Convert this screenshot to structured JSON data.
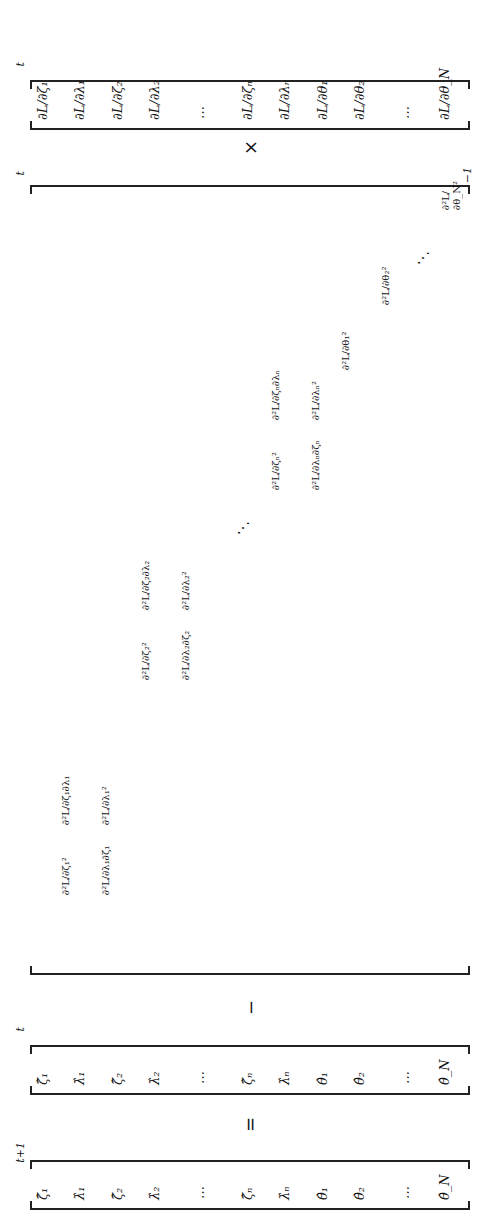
{
  "equation": {
    "lhs": {
      "label": "theta_hat_vector",
      "items": [
        "ζ̂₁",
        "λ̂₁",
        "ζ̂₂",
        "λ̂₂",
        "⋯",
        "ζ̂ₙ",
        "λ̂ₙ",
        "θ̂₁",
        "θ̂₂",
        "⋯",
        "θ̂_N"
      ],
      "superscript": "t+1"
    },
    "equals": "=",
    "current": {
      "items": [
        "ζ̂₁",
        "λ̂₁",
        "ζ̂₂",
        "λ̂₂",
        "⋯",
        "ζ̂ₙ",
        "λ̂ₙ",
        "θ̂₁",
        "θ̂₂",
        "⋯",
        "θ̂_N"
      ],
      "superscript": "t"
    },
    "minus": "−",
    "hessian": {
      "superscript": "t",
      "inverse": "−1",
      "blocks": [
        [
          "∂²L/∂ζ₁²",
          "∂²L/∂ζ₁∂λ₁",
          "∂²L/∂λ₁∂ζ₁",
          "∂²L/∂λ₁²"
        ],
        [
          "∂²L/∂ζ₂²",
          "∂²L/∂ζ₂∂λ₂",
          "∂²L/∂λ₂∂ζ₂",
          "∂²L/∂λ₂²"
        ],
        [
          "∂²L/∂ζₙ²",
          "∂²L/∂ζₙ∂λₙ",
          "∂²L/∂λₙ∂ζₙ",
          "∂²L/∂λₙ²"
        ]
      ],
      "diag": [
        "∂²L/∂θ₁²",
        "∂²L/∂θ₂²",
        "∂²L/∂θ_N²"
      ],
      "dots": "⋱"
    },
    "times": "×",
    "gradient": {
      "items": [
        "∂L/∂ζ₁",
        "∂L/∂λ₁",
        "∂L/∂ζ₂",
        "∂L/∂λ₂",
        "⋯",
        "∂L/∂ζₙ",
        "∂L/∂λₙ",
        "∂L/∂θ₁",
        "∂L/∂θ₂",
        "⋯",
        "∂L/∂θ_N"
      ],
      "superscript": "t"
    }
  }
}
